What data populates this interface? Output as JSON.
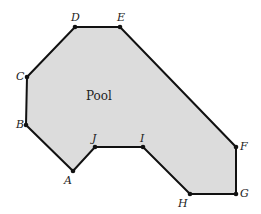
{
  "diagram": {
    "region_label": "Pool",
    "fill_color": "#dcdcdc",
    "stroke_color": "#111111",
    "vertices": [
      {
        "name": "A",
        "x": 73,
        "y": 171,
        "lx": 64,
        "ly": 184
      },
      {
        "name": "B",
        "x": 26,
        "y": 125,
        "lx": 16,
        "ly": 128
      },
      {
        "name": "C",
        "x": 27,
        "y": 77,
        "lx": 16,
        "ly": 80
      },
      {
        "name": "D",
        "x": 75,
        "y": 27,
        "lx": 71,
        "ly": 21
      },
      {
        "name": "E",
        "x": 120,
        "y": 27,
        "lx": 117,
        "ly": 21
      },
      {
        "name": "F",
        "x": 236,
        "y": 147,
        "lx": 240,
        "ly": 150
      },
      {
        "name": "G",
        "x": 236,
        "y": 194,
        "lx": 240,
        "ly": 197
      },
      {
        "name": "H",
        "x": 190,
        "y": 194,
        "lx": 178,
        "ly": 207
      },
      {
        "name": "I",
        "x": 143,
        "y": 147,
        "lx": 140,
        "ly": 142
      },
      {
        "name": "J",
        "x": 95,
        "y": 147,
        "lx": 92,
        "ly": 142
      }
    ]
  }
}
